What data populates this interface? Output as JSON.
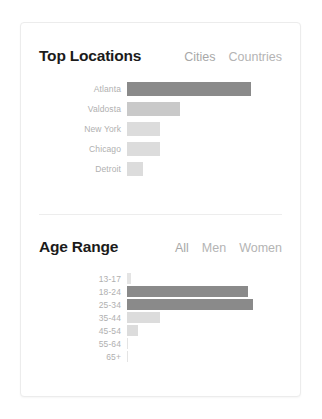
{
  "colors": {
    "bar_dark": "#8a8a8a",
    "bar_mid": "#c9c9c9",
    "bar_light": "#dcdcdc",
    "bar_faint": "#e4e4e4",
    "title": "#1b1b1b",
    "tab": "#b4b4b4",
    "label": "#b0b0b0",
    "card_border": "#ececec",
    "divider": "#ededed"
  },
  "locations": {
    "title": "Top Locations",
    "tabs": [
      {
        "label": "Cities",
        "active": true
      },
      {
        "label": "Countries",
        "active": false
      }
    ]
  },
  "age": {
    "title": "Age Range",
    "tabs": [
      {
        "label": "All",
        "active": true
      },
      {
        "label": "Men",
        "active": false
      },
      {
        "label": "Women",
        "active": false
      }
    ]
  },
  "chart_data": [
    {
      "type": "bar",
      "title": "Top Locations",
      "orientation": "horizontal",
      "categories": [
        "Atlanta",
        "Valdosta",
        "New York",
        "Chicago",
        "Detroit"
      ],
      "values": [
        100,
        43,
        27,
        27,
        13
      ],
      "colors": [
        "#8a8a8a",
        "#c9c9c9",
        "#dcdcdc",
        "#dcdcdc",
        "#dcdcdc"
      ],
      "xlabel": "",
      "ylabel": "",
      "xlim": [
        0,
        100
      ],
      "grid": false,
      "legend": false
    },
    {
      "type": "bar",
      "title": "Age Range",
      "orientation": "horizontal",
      "categories": [
        "13-17",
        "18-24",
        "25-34",
        "35-44",
        "45-54",
        "55-64",
        "65+"
      ],
      "values": [
        3,
        96,
        100,
        26,
        9,
        1,
        1
      ],
      "colors": [
        "#e4e4e4",
        "#8a8a8a",
        "#8a8a8a",
        "#dcdcdc",
        "#dcdcdc",
        "#e4e4e4",
        "#e4e4e4"
      ],
      "xlabel": "",
      "ylabel": "",
      "xlim": [
        0,
        100
      ],
      "grid": false,
      "legend": false
    }
  ]
}
